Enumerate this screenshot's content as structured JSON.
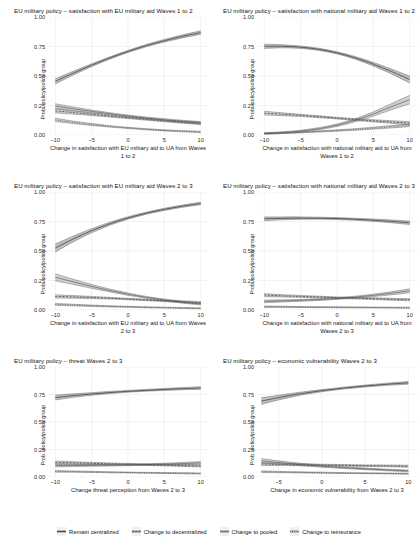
{
  "figure": {
    "ylabel": "Prob. policy/policy group",
    "y_ticks": [
      "0.00",
      "0.25",
      "0.50",
      "0.75",
      "1.00"
    ],
    "ylim": [
      0,
      1
    ]
  },
  "legend": {
    "items": [
      {
        "label": "Remain centralized",
        "key": "key-solid-band"
      },
      {
        "label": "Change to decentralized",
        "key": "key-dashed-band"
      },
      {
        "label": "Change to pooled",
        "key": "key-thin-band"
      },
      {
        "label": "Change to reinsurance",
        "key": "key-dotted-band"
      }
    ]
  },
  "chart_data": [
    {
      "type": "line",
      "title": "EU military policy – satisfaction with EU military aid Waves 1 to 2",
      "xlabel": "Change in satisfaction with EU military aid to UA from Waves 1 to 2",
      "ylabel": "Prob. policy/policy group",
      "xlim": [
        -11,
        11
      ],
      "ylim": [
        0,
        1
      ],
      "x_ticks": [
        -10,
        -5,
        0,
        5,
        10
      ],
      "y_ticks": [
        0.0,
        0.25,
        0.5,
        0.75,
        1.0
      ],
      "grid": true,
      "x": [
        -10,
        -7.5,
        -5,
        -2.5,
        0,
        2.5,
        5,
        7.5,
        10
      ],
      "series": [
        {
          "name": "Remain centralized",
          "style": "solid-band",
          "values": [
            0.455,
            0.525,
            0.592,
            0.653,
            0.708,
            0.757,
            0.799,
            0.836,
            0.868
          ],
          "ci_halfwidth": [
            0.022,
            0.016,
            0.012,
            0.01,
            0.009,
            0.01,
            0.011,
            0.013,
            0.015
          ]
        },
        {
          "name": "Change to decentralized",
          "style": "dashed-band",
          "values": [
            0.205,
            0.19,
            0.175,
            0.16,
            0.146,
            0.133,
            0.12,
            0.109,
            0.099
          ],
          "ci_halfwidth": [
            0.018,
            0.013,
            0.01,
            0.008,
            0.007,
            0.007,
            0.008,
            0.009,
            0.01
          ]
        },
        {
          "name": "Change to pooled",
          "style": "thin-band",
          "values": [
            0.245,
            0.222,
            0.2,
            0.18,
            0.161,
            0.144,
            0.129,
            0.115,
            0.103
          ],
          "ci_halfwidth": [
            0.02,
            0.015,
            0.011,
            0.009,
            0.008,
            0.008,
            0.009,
            0.01,
            0.011
          ]
        },
        {
          "name": "Change to reinsurance",
          "style": "dotted-band",
          "values": [
            0.128,
            0.107,
            0.089,
            0.073,
            0.06,
            0.049,
            0.039,
            0.032,
            0.026
          ],
          "ci_halfwidth": [
            0.014,
            0.01,
            0.008,
            0.006,
            0.005,
            0.005,
            0.005,
            0.005,
            0.006
          ]
        }
      ]
    },
    {
      "type": "line",
      "title": "EU military policy – satisfaction with national military aid Waves 1 to 2",
      "xlabel": "Change in satisfaction with national military aid to UA from Waves 1 to 2",
      "ylabel": "Prob. policy/policy group",
      "xlim": [
        -11,
        11
      ],
      "ylim": [
        0,
        1
      ],
      "x_ticks": [
        -10,
        -5,
        0,
        5,
        10
      ],
      "y_ticks": [
        0.0,
        0.25,
        0.5,
        0.75,
        1.0
      ],
      "grid": true,
      "x": [
        -10,
        -7.5,
        -5,
        -2.5,
        0,
        2.5,
        5,
        7.5,
        10
      ],
      "series": [
        {
          "name": "Remain centralized",
          "style": "solid-band",
          "values": [
            0.752,
            0.752,
            0.744,
            0.726,
            0.696,
            0.654,
            0.6,
            0.538,
            0.47
          ],
          "ci_halfwidth": [
            0.018,
            0.013,
            0.01,
            0.009,
            0.009,
            0.011,
            0.015,
            0.021,
            0.029
          ]
        },
        {
          "name": "Change to decentralized",
          "style": "dashed-band",
          "values": [
            0.185,
            0.176,
            0.166,
            0.155,
            0.143,
            0.131,
            0.12,
            0.11,
            0.101
          ],
          "ci_halfwidth": [
            0.016,
            0.012,
            0.009,
            0.008,
            0.007,
            0.008,
            0.009,
            0.011,
            0.013
          ]
        },
        {
          "name": "Change to pooled",
          "style": "thin-band",
          "values": [
            0.012,
            0.02,
            0.033,
            0.053,
            0.083,
            0.125,
            0.178,
            0.24,
            0.3
          ],
          "ci_halfwidth": [
            0.006,
            0.007,
            0.008,
            0.009,
            0.01,
            0.013,
            0.018,
            0.026,
            0.036
          ]
        },
        {
          "name": "Change to reinsurance",
          "style": "dotted-band",
          "values": [
            0.014,
            0.018,
            0.023,
            0.03,
            0.038,
            0.047,
            0.058,
            0.07,
            0.083
          ],
          "ci_halfwidth": [
            0.005,
            0.005,
            0.005,
            0.005,
            0.006,
            0.007,
            0.008,
            0.01,
            0.012
          ]
        }
      ]
    },
    {
      "type": "line",
      "title": "EU military policy – satisfaction with EU military aid Waves 2 to 3",
      "xlabel": "Change in satisfaction with EU military aid to UA from Waves 2 to 3",
      "ylabel": "Prob. policy/policy group",
      "xlim": [
        -11,
        11
      ],
      "ylim": [
        0,
        1
      ],
      "x_ticks": [
        -10,
        -5,
        0,
        5,
        10
      ],
      "y_ticks": [
        0.0,
        0.25,
        0.5,
        0.75,
        1.0
      ],
      "grid": true,
      "x": [
        -10,
        -7.5,
        -5,
        -2.5,
        0,
        2.5,
        5,
        7.5,
        10
      ],
      "series": [
        {
          "name": "Remain centralized",
          "style": "solid-band",
          "values": [
            0.525,
            0.603,
            0.672,
            0.731,
            0.78,
            0.82,
            0.853,
            0.88,
            0.903
          ],
          "ci_halfwidth": [
            0.034,
            0.024,
            0.017,
            0.013,
            0.01,
            0.009,
            0.009,
            0.01,
            0.011
          ]
        },
        {
          "name": "Change to decentralized",
          "style": "dashed-band",
          "values": [
            0.115,
            0.111,
            0.106,
            0.1,
            0.093,
            0.085,
            0.077,
            0.07,
            0.063
          ],
          "ci_halfwidth": [
            0.014,
            0.011,
            0.009,
            0.007,
            0.006,
            0.006,
            0.006,
            0.007,
            0.008
          ]
        },
        {
          "name": "Change to pooled",
          "style": "thin-band",
          "values": [
            0.278,
            0.238,
            0.2,
            0.165,
            0.134,
            0.107,
            0.085,
            0.066,
            0.051
          ],
          "ci_halfwidth": [
            0.03,
            0.022,
            0.016,
            0.012,
            0.01,
            0.008,
            0.008,
            0.008,
            0.008
          ]
        },
        {
          "name": "Change to reinsurance",
          "style": "dotted-band",
          "values": [
            0.048,
            0.042,
            0.036,
            0.031,
            0.027,
            0.023,
            0.02,
            0.017,
            0.014
          ],
          "ci_halfwidth": [
            0.008,
            0.007,
            0.006,
            0.005,
            0.004,
            0.004,
            0.004,
            0.004,
            0.004
          ]
        }
      ]
    },
    {
      "type": "line",
      "title": "EU military policy – satisfaction with national military aid Waves 2 to 3",
      "xlabel": "Change in satisfaction with national military aid to UA from Waves 2 to 3",
      "ylabel": "Prob. policy/policy group",
      "xlim": [
        -11,
        11
      ],
      "ylim": [
        0,
        1
      ],
      "x_ticks": [
        -10,
        -5,
        0,
        5,
        10
      ],
      "y_ticks": [
        0.0,
        0.25,
        0.5,
        0.75,
        1.0
      ],
      "grid": true,
      "x": [
        -10,
        -7.5,
        -5,
        -2.5,
        0,
        2.5,
        5,
        7.5,
        10
      ],
      "series": [
        {
          "name": "Remain centralized",
          "style": "solid-band",
          "values": [
            0.773,
            0.777,
            0.779,
            0.778,
            0.775,
            0.769,
            0.761,
            0.751,
            0.739
          ],
          "ci_halfwidth": [
            0.016,
            0.012,
            0.01,
            0.008,
            0.008,
            0.008,
            0.01,
            0.012,
            0.015
          ]
        },
        {
          "name": "Change to decentralized",
          "style": "dashed-band",
          "values": [
            0.126,
            0.12,
            0.115,
            0.11,
            0.105,
            0.1,
            0.096,
            0.091,
            0.087
          ],
          "ci_halfwidth": [
            0.013,
            0.01,
            0.008,
            0.007,
            0.006,
            0.006,
            0.007,
            0.008,
            0.009
          ]
        },
        {
          "name": "Change to pooled",
          "style": "thin-band",
          "values": [
            0.073,
            0.077,
            0.082,
            0.088,
            0.097,
            0.109,
            0.124,
            0.142,
            0.163
          ],
          "ci_halfwidth": [
            0.011,
            0.009,
            0.008,
            0.007,
            0.007,
            0.008,
            0.01,
            0.013,
            0.017
          ]
        },
        {
          "name": "Change to reinsurance",
          "style": "dotted-band",
          "values": [
            0.028,
            0.027,
            0.025,
            0.024,
            0.023,
            0.022,
            0.021,
            0.02,
            0.019
          ],
          "ci_halfwidth": [
            0.006,
            0.005,
            0.004,
            0.004,
            0.004,
            0.004,
            0.004,
            0.004,
            0.005
          ]
        }
      ]
    },
    {
      "type": "line",
      "title": "EU military policy – threat Waves 2 to 3",
      "xlabel": "Change threat perception from Waves 2 to 3",
      "ylabel": "Prob. policy/policy group",
      "xlim": [
        -11,
        11
      ],
      "ylim": [
        0,
        1
      ],
      "x_ticks": [
        -10,
        -5,
        0,
        5,
        10
      ],
      "y_ticks": [
        0.0,
        0.25,
        0.5,
        0.75,
        1.0
      ],
      "grid": true,
      "x": [
        -10,
        -7.5,
        -5,
        -2.5,
        0,
        2.5,
        5,
        7.5,
        10
      ],
      "series": [
        {
          "name": "Remain centralized",
          "style": "solid-band",
          "values": [
            0.722,
            0.74,
            0.755,
            0.768,
            0.779,
            0.788,
            0.796,
            0.803,
            0.809
          ],
          "ci_halfwidth": [
            0.022,
            0.016,
            0.012,
            0.01,
            0.008,
            0.008,
            0.009,
            0.01,
            0.012
          ]
        },
        {
          "name": "Change to decentralized",
          "style": "dashed-band",
          "values": [
            0.132,
            0.128,
            0.124,
            0.12,
            0.116,
            0.112,
            0.108,
            0.104,
            0.1
          ],
          "ci_halfwidth": [
            0.014,
            0.011,
            0.009,
            0.007,
            0.007,
            0.007,
            0.007,
            0.008,
            0.009
          ]
        },
        {
          "name": "Change to pooled",
          "style": "thin-band",
          "values": [
            0.105,
            0.105,
            0.106,
            0.107,
            0.11,
            0.113,
            0.117,
            0.122,
            0.128
          ],
          "ci_halfwidth": [
            0.013,
            0.01,
            0.008,
            0.007,
            0.007,
            0.007,
            0.008,
            0.01,
            0.012
          ]
        },
        {
          "name": "Change to reinsurance",
          "style": "dotted-band",
          "values": [
            0.052,
            0.049,
            0.046,
            0.043,
            0.041,
            0.038,
            0.036,
            0.034,
            0.032
          ],
          "ci_halfwidth": [
            0.008,
            0.006,
            0.005,
            0.005,
            0.004,
            0.004,
            0.004,
            0.005,
            0.005
          ]
        }
      ]
    },
    {
      "type": "line",
      "title": "EU military policy – economic vulnerability Waves 2 to 3",
      "xlabel": "Change in economic vulnerability from Waves 2 to 3",
      "ylabel": "Prob. policy/policy group",
      "xlim": [
        -7.5,
        11
      ],
      "ylim": [
        0,
        1
      ],
      "x_ticks": [
        -5,
        0,
        5,
        10
      ],
      "y_ticks": [
        0.0,
        0.25,
        0.5,
        0.75,
        1.0
      ],
      "grid": true,
      "x": [
        -7,
        -5,
        -2.5,
        0,
        2.5,
        5,
        7.5,
        10
      ],
      "series": [
        {
          "name": "Remain centralized",
          "style": "solid-band",
          "values": [
            0.69,
            0.722,
            0.757,
            0.785,
            0.808,
            0.827,
            0.843,
            0.856
          ],
          "ci_halfwidth": [
            0.03,
            0.021,
            0.014,
            0.01,
            0.009,
            0.009,
            0.01,
            0.012
          ]
        },
        {
          "name": "Change to decentralized",
          "style": "dashed-band",
          "values": [
            0.118,
            0.115,
            0.112,
            0.109,
            0.106,
            0.103,
            0.101,
            0.098
          ],
          "ci_halfwidth": [
            0.014,
            0.011,
            0.009,
            0.007,
            0.007,
            0.007,
            0.008,
            0.009
          ]
        },
        {
          "name": "Change to pooled",
          "style": "thin-band",
          "values": [
            0.148,
            0.132,
            0.114,
            0.098,
            0.085,
            0.074,
            0.064,
            0.056
          ],
          "ci_halfwidth": [
            0.02,
            0.015,
            0.011,
            0.009,
            0.008,
            0.007,
            0.007,
            0.008
          ]
        },
        {
          "name": "Change to reinsurance",
          "style": "dotted-band",
          "values": [
            0.048,
            0.045,
            0.042,
            0.039,
            0.036,
            0.034,
            0.032,
            0.03
          ],
          "ci_halfwidth": [
            0.008,
            0.006,
            0.005,
            0.005,
            0.004,
            0.004,
            0.004,
            0.005
          ]
        }
      ]
    }
  ]
}
